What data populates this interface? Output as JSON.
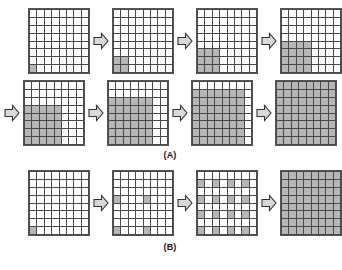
{
  "figure": {
    "title": "",
    "grid_size": {
      "rows": 8,
      "cols": 8
    },
    "fill_color": "#b6b6b6",
    "empty_color": "#ffffff",
    "line_color": "#4a4a4a",
    "arrow_glyph": "block-right-arrow"
  },
  "panels": [
    {
      "id": "A",
      "label": "(A)",
      "caption": "(A)",
      "rows": [
        {
          "leading_arrow": false,
          "steps": [
            {
              "name": "step-a1",
              "description": "single seed cell at bottom-left",
              "filled_cells": [
                [
                  7,
                  0
                ]
              ]
            },
            {
              "name": "step-a2",
              "description": "2x2 block anchored bottom-left",
              "filled_cells": [
                [
                  6,
                  0
                ],
                [
                  6,
                  1
                ],
                [
                  7,
                  0
                ],
                [
                  7,
                  1
                ]
              ]
            },
            {
              "name": "step-a3",
              "description": "3x3 block anchored bottom-left",
              "filled_cells": [
                [
                  5,
                  0
                ],
                [
                  5,
                  1
                ],
                [
                  5,
                  2
                ],
                [
                  6,
                  0
                ],
                [
                  6,
                  1
                ],
                [
                  6,
                  2
                ],
                [
                  7,
                  0
                ],
                [
                  7,
                  1
                ],
                [
                  7,
                  2
                ]
              ]
            },
            {
              "name": "step-a4",
              "description": "4x4 block anchored bottom-left",
              "filled_cells": [
                [
                  4,
                  0
                ],
                [
                  4,
                  1
                ],
                [
                  4,
                  2
                ],
                [
                  4,
                  3
                ],
                [
                  5,
                  0
                ],
                [
                  5,
                  1
                ],
                [
                  5,
                  2
                ],
                [
                  5,
                  3
                ],
                [
                  6,
                  0
                ],
                [
                  6,
                  1
                ],
                [
                  6,
                  2
                ],
                [
                  6,
                  3
                ],
                [
                  7,
                  0
                ],
                [
                  7,
                  1
                ],
                [
                  7,
                  2
                ],
                [
                  7,
                  3
                ]
              ]
            }
          ]
        },
        {
          "leading_arrow": true,
          "steps": [
            {
              "name": "step-a5",
              "description": "5x5 block anchored bottom-left",
              "filled_cells": [
                [
                  3,
                  0
                ],
                [
                  3,
                  1
                ],
                [
                  3,
                  2
                ],
                [
                  3,
                  3
                ],
                [
                  3,
                  4
                ],
                [
                  4,
                  0
                ],
                [
                  4,
                  1
                ],
                [
                  4,
                  2
                ],
                [
                  4,
                  3
                ],
                [
                  4,
                  4
                ],
                [
                  5,
                  0
                ],
                [
                  5,
                  1
                ],
                [
                  5,
                  2
                ],
                [
                  5,
                  3
                ],
                [
                  5,
                  4
                ],
                [
                  6,
                  0
                ],
                [
                  6,
                  1
                ],
                [
                  6,
                  2
                ],
                [
                  6,
                  3
                ],
                [
                  6,
                  4
                ],
                [
                  7,
                  0
                ],
                [
                  7,
                  1
                ],
                [
                  7,
                  2
                ],
                [
                  7,
                  3
                ],
                [
                  7,
                  4
                ]
              ]
            },
            {
              "name": "step-a6",
              "description": "6x6 block anchored bottom-left",
              "filled_cells": [
                [
                  2,
                  0
                ],
                [
                  2,
                  1
                ],
                [
                  2,
                  2
                ],
                [
                  2,
                  3
                ],
                [
                  2,
                  4
                ],
                [
                  2,
                  5
                ],
                [
                  3,
                  0
                ],
                [
                  3,
                  1
                ],
                [
                  3,
                  2
                ],
                [
                  3,
                  3
                ],
                [
                  3,
                  4
                ],
                [
                  3,
                  5
                ],
                [
                  4,
                  0
                ],
                [
                  4,
                  1
                ],
                [
                  4,
                  2
                ],
                [
                  4,
                  3
                ],
                [
                  4,
                  4
                ],
                [
                  4,
                  5
                ],
                [
                  5,
                  0
                ],
                [
                  5,
                  1
                ],
                [
                  5,
                  2
                ],
                [
                  5,
                  3
                ],
                [
                  5,
                  4
                ],
                [
                  5,
                  5
                ],
                [
                  6,
                  0
                ],
                [
                  6,
                  1
                ],
                [
                  6,
                  2
                ],
                [
                  6,
                  3
                ],
                [
                  6,
                  4
                ],
                [
                  6,
                  5
                ],
                [
                  7,
                  0
                ],
                [
                  7,
                  1
                ],
                [
                  7,
                  2
                ],
                [
                  7,
                  3
                ],
                [
                  7,
                  4
                ],
                [
                  7,
                  5
                ]
              ]
            },
            {
              "name": "step-a7",
              "description": "7x7 block anchored bottom-left",
              "filled_cells": [
                [
                  1,
                  0
                ],
                [
                  1,
                  1
                ],
                [
                  1,
                  2
                ],
                [
                  1,
                  3
                ],
                [
                  1,
                  4
                ],
                [
                  1,
                  5
                ],
                [
                  1,
                  6
                ],
                [
                  2,
                  0
                ],
                [
                  2,
                  1
                ],
                [
                  2,
                  2
                ],
                [
                  2,
                  3
                ],
                [
                  2,
                  4
                ],
                [
                  2,
                  5
                ],
                [
                  2,
                  6
                ],
                [
                  3,
                  0
                ],
                [
                  3,
                  1
                ],
                [
                  3,
                  2
                ],
                [
                  3,
                  3
                ],
                [
                  3,
                  4
                ],
                [
                  3,
                  5
                ],
                [
                  3,
                  6
                ],
                [
                  4,
                  0
                ],
                [
                  4,
                  1
                ],
                [
                  4,
                  2
                ],
                [
                  4,
                  3
                ],
                [
                  4,
                  4
                ],
                [
                  4,
                  5
                ],
                [
                  4,
                  6
                ],
                [
                  5,
                  0
                ],
                [
                  5,
                  1
                ],
                [
                  5,
                  2
                ],
                [
                  5,
                  3
                ],
                [
                  5,
                  4
                ],
                [
                  5,
                  5
                ],
                [
                  5,
                  6
                ],
                [
                  6,
                  0
                ],
                [
                  6,
                  1
                ],
                [
                  6,
                  2
                ],
                [
                  6,
                  3
                ],
                [
                  6,
                  4
                ],
                [
                  6,
                  5
                ],
                [
                  6,
                  6
                ],
                [
                  7,
                  0
                ],
                [
                  7,
                  1
                ],
                [
                  7,
                  2
                ],
                [
                  7,
                  3
                ],
                [
                  7,
                  4
                ],
                [
                  7,
                  5
                ],
                [
                  7,
                  6
                ]
              ]
            },
            {
              "name": "step-a8",
              "description": "entire 8x8 grid filled",
              "fill_all": true,
              "filled_cells": []
            }
          ]
        }
      ]
    },
    {
      "id": "B",
      "label": "(B)",
      "caption": "(B)",
      "rows": [
        {
          "leading_arrow": false,
          "steps": [
            {
              "name": "step-b1",
              "description": "single seed cell at bottom-left",
              "filled_cells": [
                [
                  7,
                  0
                ]
              ]
            },
            {
              "name": "step-b2",
              "description": "four scattered seeds on a coarse lattice",
              "filled_cells": [
                [
                  3,
                  0
                ],
                [
                  3,
                  4
                ],
                [
                  7,
                  0
                ],
                [
                  7,
                  4
                ]
              ]
            },
            {
              "name": "step-b3",
              "description": "alternating lattice of seeds every other row and column",
              "filled_cells": [
                [
                  1,
                  0
                ],
                [
                  1,
                  2
                ],
                [
                  1,
                  4
                ],
                [
                  1,
                  6
                ],
                [
                  3,
                  0
                ],
                [
                  3,
                  2
                ],
                [
                  3,
                  4
                ],
                [
                  3,
                  6
                ],
                [
                  5,
                  0
                ],
                [
                  5,
                  2
                ],
                [
                  5,
                  4
                ],
                [
                  5,
                  6
                ],
                [
                  7,
                  0
                ],
                [
                  7,
                  2
                ],
                [
                  7,
                  4
                ],
                [
                  7,
                  6
                ]
              ]
            },
            {
              "name": "step-b4",
              "description": "entire 8x8 grid filled",
              "fill_all": true,
              "filled_cells": []
            }
          ]
        }
      ]
    }
  ]
}
